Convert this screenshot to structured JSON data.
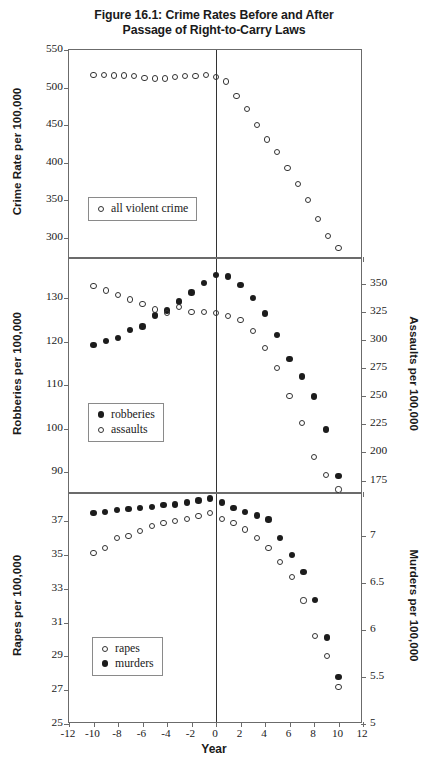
{
  "figure": {
    "title_line1": "Figure 16.1: Crime Rates Before and After",
    "title_line2": "Passage of Right-to-Carry Laws",
    "xlabel": "Year"
  },
  "chart_data": {
    "type": "scatter",
    "title": "Figure 16.1: Crime Rates Before and After Passage of Right-to-Carry Laws",
    "xlabel": "Year",
    "grid": false,
    "x": [
      -10,
      -9,
      -8,
      -7,
      -6,
      -5,
      -4,
      -3,
      -2,
      -1,
      0,
      1,
      2,
      3,
      4,
      5,
      6,
      7,
      8,
      9,
      10
    ],
    "xlim": [
      -12,
      12
    ],
    "xticks": [
      -12,
      -10,
      -8,
      -6,
      -4,
      -2,
      0,
      2,
      4,
      6,
      8,
      10,
      12
    ],
    "panels": [
      {
        "id": "panel-violent-crime",
        "left_axis": {
          "label": "Crime Rate per 100,000",
          "ticks": [
            300,
            350,
            400,
            450,
            500,
            550
          ],
          "ylim": [
            272,
            550
          ]
        },
        "legend_position": "lower-left",
        "series": [
          {
            "name": "all violent crime",
            "marker": "open-circle",
            "axis": "left",
            "values": [
              517,
              517,
              516,
              516,
              515,
              513,
              512,
              512,
              514,
              515,
              515,
              517,
              514,
              508,
              489,
              471,
              450,
              431,
              414,
              393,
              372,
              350,
              325,
              303,
              287
            ]
          }
        ]
      },
      {
        "id": "panel-robberies-assaults",
        "left_axis": {
          "label": "Robberies per 100,000",
          "ticks": [
            90,
            100,
            110,
            120,
            130
          ],
          "ylim": [
            85,
            139
          ]
        },
        "right_axis": {
          "label": "Assaults per 100,000",
          "ticks": [
            175,
            200,
            225,
            250,
            275,
            300,
            325,
            350
          ],
          "ylim": [
            163,
            372
          ]
        },
        "legend_position": "lower-left",
        "series": [
          {
            "name": "robberies",
            "marker": "filled-circle",
            "axis": "left",
            "values": [
              119.2,
              120.2,
              120.9,
              122.7,
              123.5,
              126.0,
              127.2,
              129.2,
              131.3,
              133.5,
              135.3,
              135.0,
              133.0,
              130.0,
              126.5,
              121.5,
              116.0,
              112.0,
              107.4,
              99.8,
              89.2
            ]
          },
          {
            "name": "assaults",
            "marker": "open-circle",
            "axis": "right",
            "values": [
              348,
              344,
              340,
              336,
              332,
              327,
              324,
              329,
              325,
              325,
              324,
              321,
              318,
              308,
              293,
              275,
              250,
              226,
              196,
              180,
              167
            ]
          }
        ]
      },
      {
        "id": "panel-rapes-murders",
        "left_axis": {
          "label": "Rapes per 100,000",
          "ticks": [
            25,
            27,
            29,
            31,
            33,
            35,
            37
          ],
          "ylim": [
            25,
            38.6
          ]
        },
        "right_axis": {
          "label": "Murders per 100,000",
          "ticks": [
            5.0,
            5.5,
            6.0,
            6.5,
            7.0
          ],
          "ylim": [
            5.0,
            7.45
          ]
        },
        "legend_position": "lower-left",
        "series": [
          {
            "name": "rapes",
            "marker": "open-circle",
            "axis": "left",
            "values": [
              35.1,
              35.4,
              36.0,
              36.1,
              36.4,
              36.7,
              36.9,
              37.0,
              37.1,
              37.3,
              37.5,
              37.1,
              36.9,
              36.5,
              36.0,
              35.4,
              34.6,
              33.7,
              32.3,
              30.2,
              29.0,
              27.2
            ]
          },
          {
            "name": "murders",
            "marker": "filled-circle",
            "axis": "right",
            "values": [
              7.25,
              7.26,
              7.28,
              7.29,
              7.3,
              7.31,
              7.33,
              7.34,
              7.36,
              7.38,
              7.4,
              7.36,
              7.3,
              7.26,
              7.22,
              7.18,
              6.98,
              6.8,
              6.62,
              6.32,
              5.92,
              5.5
            ]
          }
        ]
      }
    ]
  },
  "panel1": {
    "axis_label": "Crime Rate per 100,000",
    "yticks": [
      "550",
      "500",
      "450",
      "400",
      "350",
      "300"
    ],
    "legend": [
      {
        "marker": "open",
        "label": "all violent crime"
      }
    ]
  },
  "panel2": {
    "axis_label_left": "Robberies per 100,000",
    "axis_label_right": "Assaults per 100,000",
    "yticks_left": [
      "130",
      "120",
      "110",
      "100",
      "90"
    ],
    "yticks_right": [
      "350",
      "325",
      "300",
      "275",
      "250",
      "225",
      "200",
      "175"
    ],
    "legend": [
      {
        "marker": "filled",
        "label": "robberies"
      },
      {
        "marker": "open",
        "label": "assaults"
      }
    ]
  },
  "panel3": {
    "axis_label_left": "Rapes per 100,000",
    "axis_label_right": "Murders per 100,000",
    "yticks_left": [
      "37",
      "35",
      "33",
      "31",
      "29",
      "27",
      "25"
    ],
    "yticks_right": [
      "7.0",
      "6.5",
      "6.0",
      "5.5",
      "5.0"
    ],
    "legend": [
      {
        "marker": "open",
        "label": "rapes"
      },
      {
        "marker": "filled",
        "label": "murders"
      }
    ]
  },
  "xaxis": {
    "labels": [
      "-12",
      "-10",
      "-8",
      "-6",
      "-4",
      "-2",
      "0",
      "2",
      "4",
      "6",
      "8",
      "10",
      "12"
    ],
    "title": "Year"
  }
}
